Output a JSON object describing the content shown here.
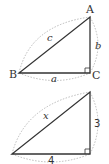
{
  "diagrams": [
    {
      "type": "right-triangle",
      "vertices": {
        "A": "A",
        "B": "B",
        "C": "C"
      },
      "sides": {
        "hypotenuse": "c",
        "vertical": "b",
        "horizontal": "a"
      },
      "right_angle_at": "C"
    },
    {
      "type": "right-triangle",
      "sides": {
        "hypotenuse": "x",
        "vertical": "3",
        "horizontal": "4"
      },
      "right_angle_at": "bottom-right"
    }
  ],
  "colors": {
    "line": "#333333",
    "dashed": "#999999"
  }
}
